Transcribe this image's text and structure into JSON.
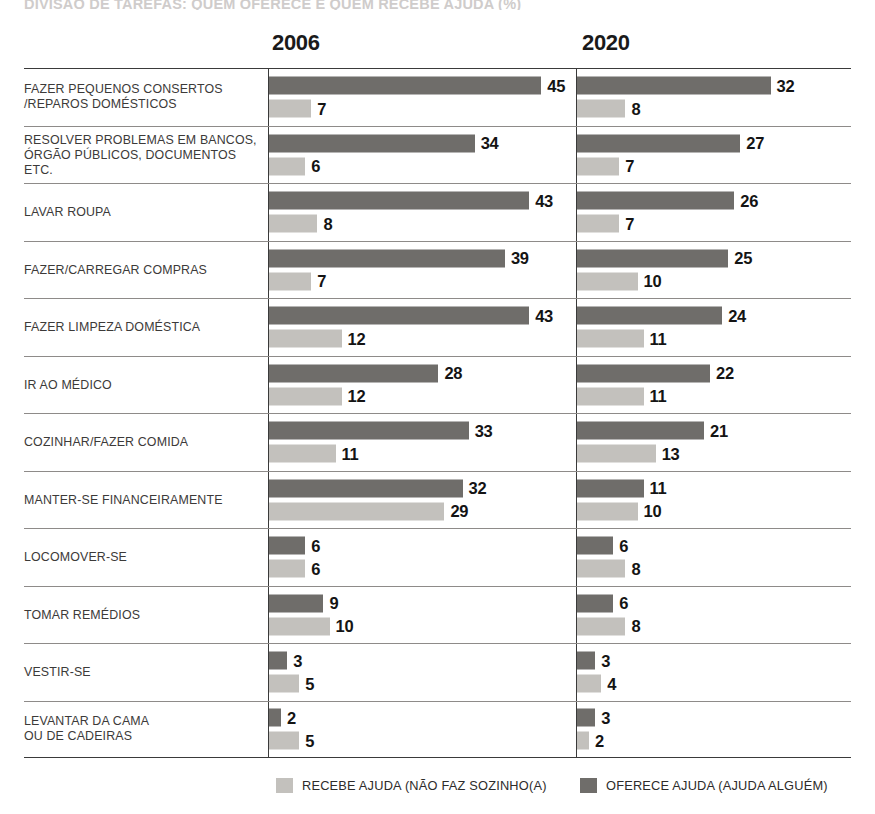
{
  "title": "DIVISÃO DE TAREFAS: QUEM OFERECE E QUEM RECEBE AJUDA (%)",
  "columns": [
    {
      "label": "2006"
    },
    {
      "label": "2020"
    }
  ],
  "legend": [
    {
      "key": "receive",
      "label": "RECEBE AJUDA (NÃO FAZ SOZINHO(A)",
      "color": "#c3c1bd"
    },
    {
      "key": "offer",
      "label": "OFERECE AJUDA (AJUDA ALGUÉM)",
      "color": "#6f6d6a"
    }
  ],
  "chart_data": {
    "type": "bar",
    "title": "DIVISÃO DE TAREFAS: QUEM OFERECE E QUEM RECEBE AJUDA (%)",
    "xlabel": "",
    "ylabel": "",
    "orientation": "horizontal",
    "grid": false,
    "legend_position": "bottom",
    "panels": [
      "2006",
      "2020"
    ],
    "xlim": [
      0,
      50
    ],
    "categories": [
      "FAZER PEQUENOS CONSERTOS\n/REPAROS DOMÉSTICOS",
      "RESOLVER PROBLEMAS EM BANCOS,\nÓRGÃO PÚBLICOS, DOCUMENTOS ETC.",
      "LAVAR ROUPA",
      "FAZER/CARREGAR COMPRAS",
      "FAZER LIMPEZA DOMÉSTICA",
      "IR AO MÉDICO",
      "COZINHAR/FAZER COMIDA",
      "MANTER-SE FINANCEIRAMENTE",
      "LOCOMOVER-SE",
      "TOMAR REMÉDIOS",
      "VESTIR-SE",
      "LEVANTAR DA CAMA\nOU DE CADEIRAS"
    ],
    "series": [
      {
        "name": "OFERECE AJUDA (AJUDA ALGUÉM) — 2006",
        "panel": "2006",
        "key": "offer",
        "values": [
          45,
          34,
          43,
          39,
          43,
          28,
          33,
          32,
          6,
          9,
          3,
          2
        ]
      },
      {
        "name": "RECEBE AJUDA (NÃO FAZ SOZINHO(A) — 2006",
        "panel": "2006",
        "key": "receive",
        "values": [
          7,
          6,
          8,
          7,
          12,
          12,
          11,
          29,
          6,
          10,
          5,
          5
        ]
      },
      {
        "name": "OFERECE AJUDA (AJUDA ALGUÉM) — 2020",
        "panel": "2020",
        "key": "offer",
        "values": [
          32,
          27,
          26,
          25,
          24,
          22,
          21,
          11,
          6,
          6,
          3,
          3
        ]
      },
      {
        "name": "RECEBE AJUDA (NÃO FAZ SOZINHO(A) — 2020",
        "panel": "2020",
        "key": "receive",
        "values": [
          8,
          7,
          7,
          10,
          11,
          11,
          13,
          10,
          8,
          8,
          4,
          2
        ]
      }
    ]
  },
  "rows": [
    {
      "label_lines": [
        "FAZER PEQUENOS CONSERTOS",
        "/REPAROS DOMÉSTICOS"
      ],
      "y2006": {
        "offer": 45,
        "receive": 7
      },
      "y2020": {
        "offer": 32,
        "receive": 8
      }
    },
    {
      "label_lines": [
        "RESOLVER PROBLEMAS EM BANCOS,",
        "ÓRGÃO PÚBLICOS, DOCUMENTOS ETC."
      ],
      "y2006": {
        "offer": 34,
        "receive": 6
      },
      "y2020": {
        "offer": 27,
        "receive": 7
      }
    },
    {
      "label_lines": [
        "LAVAR ROUPA"
      ],
      "y2006": {
        "offer": 43,
        "receive": 8
      },
      "y2020": {
        "offer": 26,
        "receive": 7
      }
    },
    {
      "label_lines": [
        "FAZER/CARREGAR COMPRAS"
      ],
      "y2006": {
        "offer": 39,
        "receive": 7
      },
      "y2020": {
        "offer": 25,
        "receive": 10
      }
    },
    {
      "label_lines": [
        "FAZER LIMPEZA DOMÉSTICA"
      ],
      "y2006": {
        "offer": 43,
        "receive": 12
      },
      "y2020": {
        "offer": 24,
        "receive": 11
      }
    },
    {
      "label_lines": [
        "IR AO MÉDICO"
      ],
      "y2006": {
        "offer": 28,
        "receive": 12
      },
      "y2020": {
        "offer": 22,
        "receive": 11
      }
    },
    {
      "label_lines": [
        "COZINHAR/FAZER COMIDA"
      ],
      "y2006": {
        "offer": 33,
        "receive": 11
      },
      "y2020": {
        "offer": 21,
        "receive": 13
      }
    },
    {
      "label_lines": [
        "MANTER-SE FINANCEIRAMENTE"
      ],
      "y2006": {
        "offer": 32,
        "receive": 29
      },
      "y2020": {
        "offer": 11,
        "receive": 10
      }
    },
    {
      "label_lines": [
        "LOCOMOVER-SE"
      ],
      "y2006": {
        "offer": 6,
        "receive": 6
      },
      "y2020": {
        "offer": 6,
        "receive": 8
      }
    },
    {
      "label_lines": [
        "TOMAR REMÉDIOS"
      ],
      "y2006": {
        "offer": 9,
        "receive": 10
      },
      "y2020": {
        "offer": 6,
        "receive": 8
      }
    },
    {
      "label_lines": [
        "VESTIR-SE"
      ],
      "y2006": {
        "offer": 3,
        "receive": 5
      },
      "y2020": {
        "offer": 3,
        "receive": 4
      }
    },
    {
      "label_lines": [
        "LEVANTAR DA CAMA",
        "OU DE CADEIRAS"
      ],
      "y2006": {
        "offer": 2,
        "receive": 5
      },
      "y2020": {
        "offer": 3,
        "receive": 2
      }
    }
  ],
  "scale": {
    "px_per_unit_2006": 6.05,
    "px_per_unit_2020": 6.05,
    "min_bar_px": 11
  }
}
